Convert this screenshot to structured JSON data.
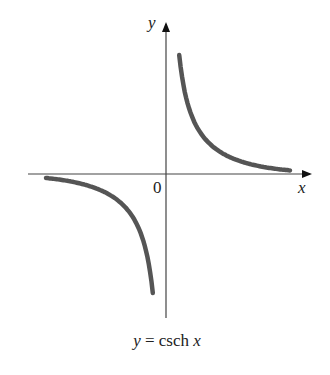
{
  "chart_data": {
    "type": "line",
    "title": "",
    "caption": "y = csch x",
    "caption_parts": {
      "lhs": "y",
      "eq": " = csch ",
      "var": "x"
    },
    "xlabel": "x",
    "ylabel": "y",
    "origin_label": "0",
    "xlim": [
      -3.45,
      3.65
    ],
    "ylim": [
      -3.6,
      3.8
    ],
    "grid": false,
    "legend": null,
    "series": [
      {
        "name": "csch x (x < 0)",
        "x": [
          -3.0,
          -2.5,
          -2.0,
          -1.5,
          -1.0,
          -0.75,
          -0.5,
          -0.4,
          -0.33
        ],
        "y": [
          -0.1,
          -0.16,
          -0.28,
          -0.47,
          -0.85,
          -1.22,
          -1.92,
          -2.43,
          -2.97
        ]
      },
      {
        "name": "csch x (x > 0)",
        "x": [
          0.33,
          0.4,
          0.5,
          0.75,
          1.0,
          1.5,
          2.0,
          2.5,
          3.1
        ],
        "y": [
          2.97,
          2.43,
          1.92,
          1.22,
          0.85,
          0.47,
          0.28,
          0.16,
          0.09
        ]
      }
    ],
    "colors": {
      "curve": "#555555",
      "axis": "#444444"
    }
  }
}
